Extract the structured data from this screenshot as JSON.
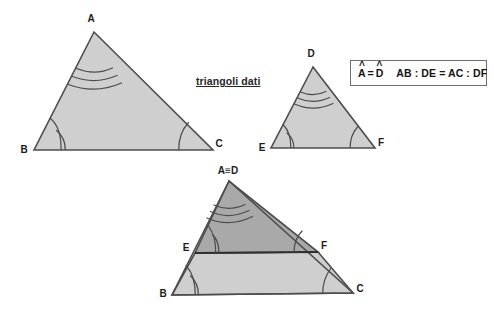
{
  "diagram": {
    "title_caption": "triangoli dati",
    "background_color": "#ffffff",
    "stroke_color": "#4d4d4d",
    "fill_light": "#cfcfcf",
    "fill_dark": "#a9a9a9",
    "legend": {
      "angle_left": "A",
      "angle_left_hat": "^",
      "equals": "=",
      "angle_right": "D",
      "angle_right_hat": "^",
      "ratio": "AB : DE = AC : DF"
    },
    "triangle_abc": {
      "name": "triangolo ABC",
      "vertices": {
        "A": {
          "label": "A",
          "x": 94,
          "y": 32
        },
        "B": {
          "label": "B",
          "x": 34,
          "y": 150
        },
        "C": {
          "label": "C",
          "x": 213,
          "y": 150
        }
      },
      "angle_marks": {
        "A": 3,
        "B": 2,
        "C": 1
      }
    },
    "triangle_def": {
      "name": "triangolo DEF",
      "vertices": {
        "D": {
          "label": "D",
          "x": 313,
          "y": 67
        },
        "E": {
          "label": "E",
          "x": 271,
          "y": 148
        },
        "F": {
          "label": "F",
          "x": 375,
          "y": 148
        }
      },
      "angle_marks": {
        "D": 3,
        "E": 2,
        "F": 1
      }
    },
    "triangle_overlay": {
      "name": "sovrapposizione ABC e DEF",
      "apex_label": "A≡D",
      "vertices": {
        "AD": {
          "label": "A≡D",
          "x": 229,
          "y": 181
        },
        "B": {
          "label": "B",
          "x": 172,
          "y": 295
        },
        "C": {
          "label": "C",
          "x": 353,
          "y": 293
        },
        "E": {
          "label": "E",
          "x": 195,
          "y": 253
        },
        "F": {
          "label": "F",
          "x": 318,
          "y": 252
        }
      },
      "angle_marks": {
        "AD": 3,
        "E": 2,
        "F": 1,
        "B": 2,
        "C": 1
      }
    }
  }
}
